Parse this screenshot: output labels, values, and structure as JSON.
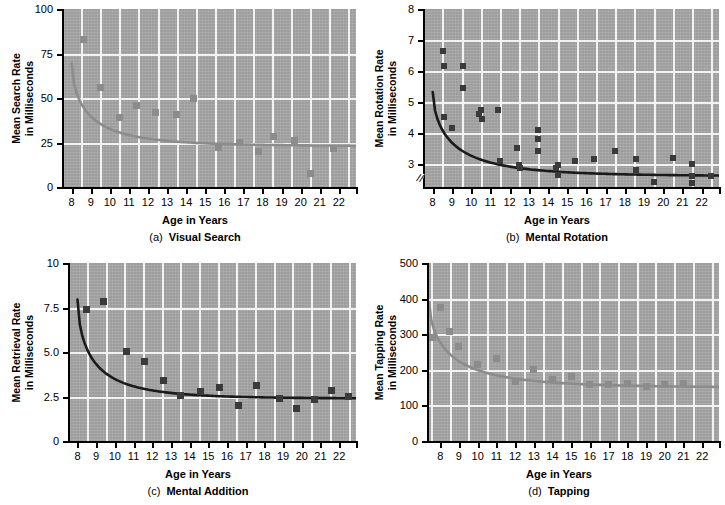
{
  "figure": {
    "xlabel": "Age in Years",
    "xticks": [
      8,
      9,
      10,
      11,
      12,
      13,
      14,
      15,
      16,
      17,
      18,
      19,
      20,
      21,
      22
    ],
    "plot_bg": "#a8a8a8",
    "grid_color": "#f2f2f2"
  },
  "chart_data": [
    {
      "type": "scatter",
      "panel": "a",
      "caption_prefix": "(a)",
      "caption": "Visual Search",
      "title": "",
      "xlabel": "Age in Years",
      "ylabel": "Mean Search Rate\nin Milliseconds",
      "ylabel_line1": "Mean Search Rate",
      "ylabel_line2": "in Milliseconds",
      "xlim": [
        7.6,
        22.9
      ],
      "ylim": [
        0,
        100
      ],
      "yticks": [
        0,
        25,
        50,
        75,
        100
      ],
      "ytick_labels": [
        "0",
        "25",
        "50",
        "75",
        "100"
      ],
      "grid": true,
      "axis_break": false,
      "marker_color": "#8c8c8c",
      "curve_color": "#8c8c8c",
      "marker_shape": "square",
      "x": [
        8.6,
        9.5,
        10.5,
        11.4,
        12.4,
        13.5,
        14.4,
        15.7,
        16.8,
        17.8,
        18.6,
        19.7,
        20.5,
        21.7
      ],
      "y": [
        83,
        56,
        39,
        46,
        42,
        41,
        49.5,
        22,
        25,
        20,
        28.5,
        26,
        7.5,
        21.5
      ],
      "curve": {
        "note": "decaying power fit",
        "x0": 8.0,
        "y0": 69.5,
        "x1": 22.9,
        "y1": 23.2,
        "asymptote": 23.0
      }
    },
    {
      "type": "scatter",
      "panel": "b",
      "caption_prefix": "(b)",
      "caption": "Mental Rotation",
      "title": "",
      "xlabel": "Age in Years",
      "ylabel": "Mean Rotation Rate\nin Milliseconds",
      "ylabel_line1": "Mean Rotation Rate",
      "ylabel_line2": "in Milliseconds",
      "xlim": [
        7.6,
        22.9
      ],
      "ylim": [
        2.25,
        8
      ],
      "yticks": [
        3,
        4,
        5,
        6,
        7,
        8
      ],
      "ytick_labels": [
        "3",
        "4",
        "5",
        "6",
        "7",
        "8"
      ],
      "grid": true,
      "axis_break": true,
      "marker_color": "#3a3a3a",
      "curve_color": "#1a1a1a",
      "marker_shape": "square",
      "x": [
        8.55,
        8.6,
        8.6,
        9.0,
        9.6,
        9.6,
        10.4,
        10.5,
        10.55,
        11.4,
        11.5,
        12.4,
        12.5,
        12.55,
        13.5,
        13.5,
        13.5,
        14.4,
        14.5,
        14.5,
        15.4,
        16.4,
        17.5,
        18.6,
        18.6,
        19.5,
        20.5,
        21.5,
        21.5,
        21.5,
        22.5
      ],
      "y": [
        6.65,
        6.15,
        4.5,
        4.15,
        6.15,
        5.45,
        4.6,
        4.75,
        4.45,
        4.75,
        3.1,
        3.5,
        2.95,
        2.85,
        4.1,
        3.8,
        3.4,
        2.85,
        2.65,
        2.95,
        3.1,
        3.15,
        3.4,
        3.15,
        2.8,
        2.4,
        3.2,
        2.98,
        2.6,
        2.38,
        2.6
      ],
      "curve": {
        "note": "decaying power fit",
        "x0": 8.0,
        "y0": 5.32,
        "x1": 22.9,
        "y1": 2.62,
        "asymptote": 2.6
      }
    },
    {
      "type": "scatter",
      "panel": "c",
      "caption_prefix": "(c)",
      "caption": "Mental Addition",
      "title": "",
      "xlabel": "Age in Years",
      "ylabel": "Mean Retrieval Rate\nin Milliseconds",
      "ylabel_line1": "Mean Retrieval Rate",
      "ylabel_line2": "in Milliseconds",
      "xlim": [
        7.6,
        22.9
      ],
      "ylim": [
        0,
        10
      ],
      "yticks": [
        0,
        2.5,
        5.0,
        7.5,
        10
      ],
      "ytick_labels": [
        "0",
        "2.5",
        "5.0",
        "7.5",
        "10"
      ],
      "grid": true,
      "axis_break": false,
      "marker_color": "#3a3a3a",
      "curve_color": "#1a1a1a",
      "marker_shape": "square",
      "x": [
        8.5,
        9.4,
        10.6,
        11.6,
        12.6,
        13.5,
        14.6,
        15.6,
        16.6,
        17.6,
        18.8,
        19.7,
        20.7,
        21.6,
        22.5
      ],
      "y": [
        7.4,
        7.85,
        5.05,
        4.45,
        3.4,
        2.55,
        2.8,
        3.0,
        2.0,
        3.1,
        2.4,
        1.85,
        2.35,
        2.85,
        2.5
      ],
      "curve": {
        "note": "decaying power fit",
        "x0": 8.0,
        "y0": 7.95,
        "x1": 22.9,
        "y1": 2.4,
        "asymptote": 2.38
      }
    },
    {
      "type": "scatter",
      "panel": "d",
      "caption_prefix": "(d)",
      "caption": "Tapping",
      "title": "",
      "xlabel": "Age in Years",
      "ylabel": "Mean Tapping Rate\nin Milliseconds",
      "ylabel_line1": "Mean Tapping Rate",
      "ylabel_line2": "in Milliseconds",
      "xlim": [
        7.4,
        22.9
      ],
      "ylim": [
        0,
        500
      ],
      "yticks": [
        0,
        100,
        200,
        300,
        400,
        500
      ],
      "ytick_labels": [
        "0",
        "100",
        "200",
        "300",
        "400",
        "500"
      ],
      "grid": true,
      "axis_break": false,
      "marker_color": "#8c8c8c",
      "curve_color": "#8c8c8c",
      "marker_shape": "square",
      "x": [
        7.6,
        8.0,
        8.5,
        9.0,
        10.0,
        11.0,
        12.0,
        13.0,
        14.0,
        15.0,
        16.0,
        17.0,
        18.0,
        19.0,
        20.0,
        21.0
      ],
      "y": [
        290,
        375,
        308,
        266,
        216,
        232,
        168,
        200,
        174,
        180,
        160,
        159,
        162,
        153,
        160,
        161
      ],
      "curve": {
        "note": "decaying power fit",
        "x0": 7.4,
        "y0": 390,
        "x1": 22.9,
        "y1": 152,
        "asymptote": 150
      }
    }
  ]
}
